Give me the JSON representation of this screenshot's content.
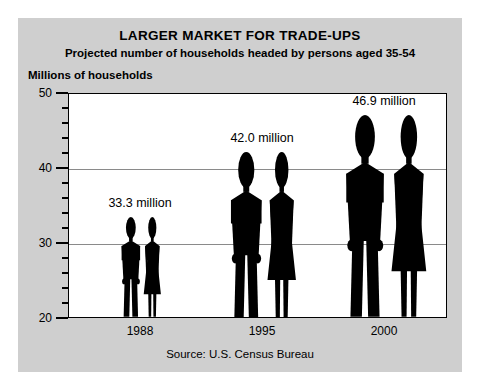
{
  "chart_data": {
    "type": "bar",
    "title": "LARGER MARKET FOR TRADE-UPS",
    "subtitle": "Projected number of households headed by persons aged 35-54",
    "ylabel": "Millions of households",
    "xlabel": "",
    "categories": [
      "1988",
      "1995",
      "2000"
    ],
    "values": [
      33.3,
      42.0,
      46.9
    ],
    "data_labels": [
      "33.3 million",
      "42.0 million",
      "46.9 million"
    ],
    "ylim": [
      20,
      50
    ],
    "y_major_ticks": [
      20,
      30,
      40,
      50
    ],
    "y_tick_labels": [
      "20",
      "30",
      "40",
      "50"
    ],
    "y_minor_tick_interval": 2,
    "gridlines": [
      30,
      40
    ],
    "grid": true,
    "legend": "none",
    "source": "Source: U.S. Census Bureau",
    "units": "millions of households",
    "marker_style": "human-pictogram-pair",
    "colors": {
      "figure": "#000000",
      "panel_background": "#cfcfcf",
      "plot_background": "#ffffff",
      "gridline": "#8a8a8a",
      "axis": "#000000",
      "text": "#000000"
    }
  },
  "axis": {
    "y_labels": [
      {
        "text": "50",
        "value": 50
      },
      {
        "text": "40",
        "value": 40
      },
      {
        "text": "30",
        "value": 30
      },
      {
        "text": "20",
        "value": 20
      }
    ],
    "x_labels": [
      {
        "text": "1988"
      },
      {
        "text": "1995"
      },
      {
        "text": "2000"
      }
    ]
  },
  "groups": [
    {
      "year": "1988",
      "value": 33.3,
      "label": "33.3 million"
    },
    {
      "year": "1995",
      "value": 42.0,
      "label": "42.0 million"
    },
    {
      "year": "2000",
      "value": 46.9,
      "label": "46.9 million"
    }
  ]
}
